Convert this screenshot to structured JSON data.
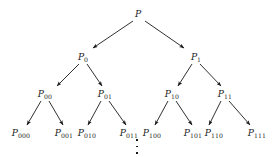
{
  "figure": {
    "type": "binary-tree-diagram",
    "title": "",
    "background_color": "#ffffff",
    "edge_color": "#1a1a1a",
    "text_color": "#1a1a1a",
    "levels": 4,
    "continues_below": true
  },
  "nodes": [
    {
      "id": "root",
      "base": "P",
      "subscript": "",
      "x": 138,
      "y": 14,
      "level": 0
    },
    {
      "id": "n0",
      "base": "P",
      "subscript": "0",
      "x": 83,
      "y": 57,
      "level": 1
    },
    {
      "id": "n1",
      "base": "P",
      "subscript": "1",
      "x": 196,
      "y": 57,
      "level": 1
    },
    {
      "id": "n00",
      "base": "P",
      "subscript": "00",
      "x": 45,
      "y": 94,
      "level": 2
    },
    {
      "id": "n01",
      "base": "P",
      "subscript": "01",
      "x": 105,
      "y": 94,
      "level": 2
    },
    {
      "id": "n10",
      "base": "P",
      "subscript": "10",
      "x": 172,
      "y": 94,
      "level": 2
    },
    {
      "id": "n11",
      "base": "P",
      "subscript": "11",
      "x": 225,
      "y": 94,
      "level": 2
    },
    {
      "id": "n000",
      "base": "P",
      "subscript": "000",
      "x": 21,
      "y": 133,
      "level": 3
    },
    {
      "id": "n001",
      "base": "P",
      "subscript": "001",
      "x": 64,
      "y": 133,
      "level": 3
    },
    {
      "id": "n010",
      "base": "P",
      "subscript": "010",
      "x": 87,
      "y": 133,
      "level": 3
    },
    {
      "id": "n011",
      "base": "P",
      "subscript": "011",
      "x": 129,
      "y": 133,
      "level": 3
    },
    {
      "id": "n100",
      "base": "P",
      "subscript": "100",
      "x": 152,
      "y": 133,
      "level": 3
    },
    {
      "id": "n101",
      "base": "P",
      "subscript": "101",
      "x": 193,
      "y": 133,
      "level": 3
    },
    {
      "id": "n110",
      "base": "P",
      "subscript": "110",
      "x": 214,
      "y": 133,
      "level": 3
    },
    {
      "id": "n111",
      "base": "P",
      "subscript": "111",
      "x": 257,
      "y": 133,
      "level": 3
    }
  ],
  "edges": [
    {
      "from": "root",
      "to": "n0",
      "x1": 133,
      "y1": 21,
      "x2": 93,
      "y2": 48
    },
    {
      "from": "root",
      "to": "n1",
      "x1": 145,
      "y1": 21,
      "x2": 184,
      "y2": 48
    },
    {
      "from": "n0",
      "to": "n00",
      "x1": 79,
      "y1": 64,
      "x2": 57,
      "y2": 86
    },
    {
      "from": "n0",
      "to": "n01",
      "x1": 87,
      "y1": 64,
      "x2": 102,
      "y2": 86
    },
    {
      "from": "n1",
      "to": "n10",
      "x1": 192,
      "y1": 64,
      "x2": 178,
      "y2": 86
    },
    {
      "from": "n1",
      "to": "n11",
      "x1": 200,
      "y1": 64,
      "x2": 221,
      "y2": 86
    },
    {
      "from": "n00",
      "to": "n000",
      "x1": 41,
      "y1": 101,
      "x2": 27,
      "y2": 125
    },
    {
      "from": "n00",
      "to": "n001",
      "x1": 49,
      "y1": 101,
      "x2": 63,
      "y2": 125
    },
    {
      "from": "n01",
      "to": "n010",
      "x1": 101,
      "y1": 101,
      "x2": 88,
      "y2": 125
    },
    {
      "from": "n01",
      "to": "n011",
      "x1": 109,
      "y1": 101,
      "x2": 126,
      "y2": 125
    },
    {
      "from": "n10",
      "to": "n100",
      "x1": 168,
      "y1": 101,
      "x2": 155,
      "y2": 125
    },
    {
      "from": "n10",
      "to": "n101",
      "x1": 176,
      "y1": 101,
      "x2": 192,
      "y2": 125
    },
    {
      "from": "n11",
      "to": "n110",
      "x1": 221,
      "y1": 101,
      "x2": 209,
      "y2": 125
    },
    {
      "from": "n11",
      "to": "n111",
      "x1": 229,
      "y1": 101,
      "x2": 250,
      "y2": 125
    }
  ],
  "ellipsis": {
    "name": "vertical-ellipsis",
    "x": 137,
    "y": 139,
    "dots": 3
  }
}
